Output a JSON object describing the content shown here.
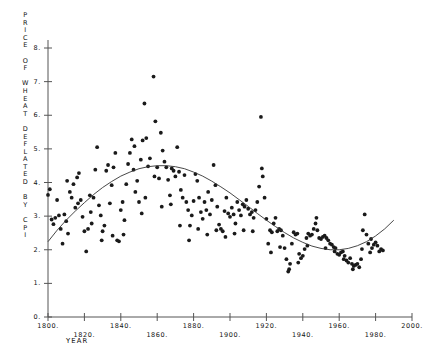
{
  "chart_data": {
    "type": "scatter",
    "title": "",
    "subtitle": "",
    "xlabel": "YEAR",
    "ylabel": "PRICE OF WHEAT DEFLATED BY CPI",
    "ylabel_chars": [
      "P",
      "R",
      "I",
      "C",
      "E",
      "",
      "O",
      "F",
      "",
      "W",
      "H",
      "E",
      "A",
      "T",
      "",
      "D",
      "E",
      "F",
      "L",
      "A",
      "T",
      "E",
      "D",
      "",
      "B",
      "Y",
      "",
      "C",
      "P",
      "I"
    ],
    "xlim": [
      1800,
      2000
    ],
    "ylim": [
      0,
      8.4
    ],
    "xticks": [
      1800,
      1820,
      1840,
      1860,
      1880,
      1900,
      1920,
      1940,
      1960,
      1980,
      2000
    ],
    "xtick_labels": [
      "1800.",
      "1820.",
      "1840.",
      "1860.",
      "1880.",
      "1900.",
      "1920.",
      "1940.",
      "1960.",
      "1980.",
      "2000."
    ],
    "yticks": [
      0,
      1,
      2,
      3,
      4,
      5,
      6,
      7,
      8
    ],
    "ytick_labels": [
      "0.",
      "1.",
      "2.",
      "3.",
      "4.",
      "5.",
      "6.",
      "7.",
      "8."
    ],
    "grid": false,
    "legend": null,
    "marker": "dot",
    "marker_color": "#1a1a1a",
    "marker_size": 1.9,
    "fit_line_color": "#333333",
    "fit_line_label": "smoothed trend (cubic fit)",
    "axis_color": "#555555",
    "series": [
      {
        "name": "Price of wheat deflated by CPI",
        "points": [
          [
            1800,
            3.63
          ],
          [
            1801,
            3.8
          ],
          [
            1802,
            2.9
          ],
          [
            1803,
            2.76
          ],
          [
            1804,
            2.95
          ],
          [
            1805,
            3.48
          ],
          [
            1806,
            3.02
          ],
          [
            1807,
            2.62
          ],
          [
            1808,
            2.18
          ],
          [
            1809,
            3.05
          ],
          [
            1810,
            2.85
          ],
          [
            1811,
            2.48
          ],
          [
            1812,
            3.72
          ],
          [
            1813,
            3.55
          ],
          [
            1814,
            3.95
          ],
          [
            1815,
            3.25
          ],
          [
            1816,
            4.15
          ],
          [
            1817,
            4.28
          ],
          [
            1818,
            3.48
          ],
          [
            1819,
            2.98
          ],
          [
            1820,
            2.55
          ],
          [
            1821,
            1.95
          ],
          [
            1822,
            2.62
          ],
          [
            1823,
            3.62
          ],
          [
            1824,
            2.78
          ],
          [
            1825,
            3.55
          ],
          [
            1826,
            4.38
          ],
          [
            1827,
            5.05
          ],
          [
            1828,
            3.32
          ],
          [
            1829,
            3.02
          ],
          [
            1830,
            2.55
          ],
          [
            1831,
            2.72
          ],
          [
            1832,
            4.35
          ],
          [
            1833,
            4.52
          ],
          [
            1834,
            3.38
          ],
          [
            1835,
            3.92
          ],
          [
            1836,
            4.45
          ],
          [
            1837,
            4.88
          ],
          [
            1838,
            2.28
          ],
          [
            1839,
            2.25
          ],
          [
            1840,
            3.18
          ],
          [
            1841,
            3.42
          ],
          [
            1842,
            2.88
          ],
          [
            1843,
            3.95
          ],
          [
            1844,
            4.55
          ],
          [
            1845,
            4.88
          ],
          [
            1846,
            5.28
          ],
          [
            1847,
            4.38
          ],
          [
            1848,
            3.72
          ],
          [
            1849,
            4.05
          ],
          [
            1850,
            3.42
          ],
          [
            1851,
            4.68
          ],
          [
            1852,
            5.25
          ],
          [
            1853,
            6.35
          ],
          [
            1854,
            5.32
          ],
          [
            1855,
            4.48
          ],
          [
            1856,
            4.72
          ],
          [
            1857,
            8.55
          ],
          [
            1858,
            7.15
          ],
          [
            1859,
            5.82
          ],
          [
            1860,
            4.45
          ],
          [
            1861,
            4.12
          ],
          [
            1862,
            5.48
          ],
          [
            1863,
            4.95
          ],
          [
            1864,
            4.62
          ],
          [
            1865,
            4.45
          ],
          [
            1866,
            4.08
          ],
          [
            1867,
            3.62
          ],
          [
            1868,
            4.42
          ],
          [
            1869,
            4.35
          ],
          [
            1870,
            4.18
          ],
          [
            1871,
            5.05
          ],
          [
            1872,
            4.32
          ],
          [
            1873,
            3.78
          ],
          [
            1874,
            3.55
          ],
          [
            1875,
            4.22
          ],
          [
            1876,
            3.42
          ],
          [
            1877,
            3.18
          ],
          [
            1878,
            2.72
          ],
          [
            1879,
            3.02
          ],
          [
            1880,
            3.45
          ],
          [
            1881,
            4.25
          ],
          [
            1882,
            4.05
          ],
          [
            1883,
            3.55
          ],
          [
            1884,
            3.12
          ],
          [
            1885,
            2.92
          ],
          [
            1886,
            3.42
          ],
          [
            1887,
            3.18
          ],
          [
            1888,
            3.72
          ],
          [
            1889,
            3.05
          ],
          [
            1890,
            3.48
          ],
          [
            1891,
            4.52
          ],
          [
            1892,
            3.92
          ],
          [
            1893,
            3.28
          ],
          [
            1894,
            2.75
          ],
          [
            1895,
            2.62
          ],
          [
            1896,
            2.55
          ],
          [
            1897,
            3.15
          ],
          [
            1898,
            3.55
          ],
          [
            1899,
            3.08
          ],
          [
            1900,
            2.98
          ],
          [
            1901,
            3.25
          ],
          [
            1902,
            3.05
          ],
          [
            1903,
            2.78
          ],
          [
            1904,
            3.42
          ],
          [
            1905,
            3.18
          ],
          [
            1906,
            3.02
          ],
          [
            1907,
            3.35
          ],
          [
            1908,
            3.28
          ],
          [
            1909,
            3.48
          ],
          [
            1910,
            3.22
          ],
          [
            1911,
            3.05
          ],
          [
            1912,
            3.12
          ],
          [
            1913,
            2.95
          ],
          [
            1914,
            3.18
          ],
          [
            1915,
            3.42
          ],
          [
            1916,
            3.88
          ],
          [
            1917,
            5.95
          ],
          [
            1918,
            4.18
          ],
          [
            1919,
            3.55
          ],
          [
            1920,
            2.92
          ],
          [
            1921,
            2.18
          ],
          [
            1922,
            2.58
          ],
          [
            1923,
            2.52
          ],
          [
            1924,
            2.78
          ],
          [
            1925,
            2.95
          ],
          [
            1926,
            2.55
          ],
          [
            1927,
            2.62
          ],
          [
            1928,
            2.58
          ],
          [
            1929,
            2.42
          ],
          [
            1930,
            2.05
          ],
          [
            1931,
            1.72
          ],
          [
            1932,
            1.35
          ],
          [
            1933,
            1.58
          ],
          [
            1934,
            2.18
          ],
          [
            1935,
            2.52
          ],
          [
            1936,
            2.45
          ],
          [
            1937,
            2.48
          ],
          [
            1938,
            1.88
          ],
          [
            1939,
            1.75
          ],
          [
            1940,
            1.82
          ],
          [
            1941,
            2.02
          ],
          [
            1942,
            2.35
          ],
          [
            1943,
            2.48
          ],
          [
            1944,
            2.42
          ],
          [
            1945,
            2.45
          ],
          [
            1946,
            2.62
          ],
          [
            1947,
            2.78
          ],
          [
            1948,
            2.58
          ],
          [
            1949,
            2.35
          ],
          [
            1950,
            2.32
          ],
          [
            1951,
            2.38
          ],
          [
            1952,
            2.42
          ],
          [
            1953,
            2.35
          ],
          [
            1954,
            2.28
          ],
          [
            1955,
            2.18
          ],
          [
            1956,
            2.15
          ],
          [
            1957,
            2.08
          ],
          [
            1958,
            2.05
          ],
          [
            1959,
            1.88
          ],
          [
            1960,
            1.85
          ],
          [
            1961,
            1.92
          ],
          [
            1962,
            1.95
          ],
          [
            1963,
            1.82
          ],
          [
            1964,
            1.68
          ],
          [
            1965,
            1.62
          ],
          [
            1966,
            1.75
          ],
          [
            1967,
            1.58
          ],
          [
            1968,
            1.52
          ],
          [
            1969,
            1.55
          ],
          [
            1970,
            1.58
          ],
          [
            1971,
            1.48
          ],
          [
            1972,
            1.72
          ],
          [
            1973,
            2.58
          ],
          [
            1974,
            3.05
          ],
          [
            1975,
            2.45
          ],
          [
            1976,
            2.18
          ],
          [
            1977,
            1.92
          ],
          [
            1978,
            2.05
          ],
          [
            1979,
            2.15
          ],
          [
            1980,
            2.22
          ],
          [
            1981,
            2.12
          ],
          [
            1982,
            1.95
          ],
          [
            1983,
            2.02
          ],
          [
            1984,
            1.98
          ],
          [
            1810.5,
            4.05
          ],
          [
            1816.5,
            3.38
          ],
          [
            1823.5,
            3.12
          ],
          [
            1829.5,
            2.28
          ],
          [
            1835.5,
            2.42
          ],
          [
            1841.5,
            2.45
          ],
          [
            1847.5,
            5.08
          ],
          [
            1851.5,
            3.08
          ],
          [
            1853.5,
            3.55
          ],
          [
            1858.5,
            4.18
          ],
          [
            1862.5,
            3.28
          ],
          [
            1867.5,
            3.35
          ],
          [
            1872.5,
            2.72
          ],
          [
            1877.5,
            2.28
          ],
          [
            1882.5,
            2.62
          ],
          [
            1887.5,
            2.45
          ],
          [
            1892.5,
            2.58
          ],
          [
            1897.5,
            2.38
          ],
          [
            1902.5,
            2.48
          ],
          [
            1907.5,
            2.58
          ],
          [
            1912.5,
            2.55
          ],
          [
            1917.5,
            4.42
          ],
          [
            1922.5,
            1.92
          ],
          [
            1927.5,
            2.08
          ],
          [
            1932.5,
            1.42
          ],
          [
            1937.5,
            1.62
          ],
          [
            1942.5,
            2.12
          ],
          [
            1947.5,
            2.95
          ],
          [
            1952.5,
            2.05
          ],
          [
            1957.5,
            1.95
          ],
          [
            1962.5,
            1.72
          ],
          [
            1967.5,
            1.42
          ],
          [
            1972.5,
            2.02
          ],
          [
            1977.5,
            2.32
          ]
        ]
      }
    ],
    "fit_curve": {
      "name": "fitted cubic trend",
      "points": [
        [
          1800,
          2.24
        ],
        [
          1805,
          2.58
        ],
        [
          1810,
          2.88
        ],
        [
          1815,
          3.15
        ],
        [
          1820,
          3.4
        ],
        [
          1825,
          3.64
        ],
        [
          1830,
          3.85
        ],
        [
          1835,
          4.03
        ],
        [
          1840,
          4.19
        ],
        [
          1845,
          4.31
        ],
        [
          1850,
          4.41
        ],
        [
          1855,
          4.47
        ],
        [
          1860,
          4.5
        ],
        [
          1865,
          4.5
        ],
        [
          1870,
          4.47
        ],
        [
          1875,
          4.41
        ],
        [
          1880,
          4.31
        ],
        [
          1885,
          4.19
        ],
        [
          1890,
          4.04
        ],
        [
          1895,
          3.87
        ],
        [
          1900,
          3.69
        ],
        [
          1905,
          3.49
        ],
        [
          1910,
          3.29
        ],
        [
          1915,
          3.08
        ],
        [
          1920,
          2.88
        ],
        [
          1925,
          2.69
        ],
        [
          1930,
          2.51
        ],
        [
          1935,
          2.35
        ],
        [
          1940,
          2.22
        ],
        [
          1945,
          2.11
        ],
        [
          1950,
          2.04
        ],
        [
          1955,
          2.0
        ],
        [
          1960,
          2.0
        ],
        [
          1965,
          2.04
        ],
        [
          1970,
          2.12
        ],
        [
          1975,
          2.24
        ],
        [
          1980,
          2.41
        ],
        [
          1985,
          2.62
        ],
        [
          1990,
          2.88
        ]
      ]
    }
  }
}
